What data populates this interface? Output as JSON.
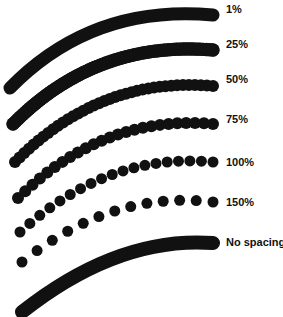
{
  "figure": {
    "background_color": "#ffffff",
    "ink_color": "#111111",
    "width": 283,
    "height": 317
  },
  "labels": [
    {
      "text": "1%",
      "x": 226,
      "y": 3
    },
    {
      "text": "25%",
      "x": 226,
      "y": 38
    },
    {
      "text": "50%",
      "x": 226,
      "y": 73
    },
    {
      "text": "75%",
      "x": 226,
      "y": 113
    },
    {
      "text": "100%",
      "x": 226,
      "y": 156
    },
    {
      "text": "150%",
      "x": 226,
      "y": 196
    },
    {
      "text": "No spacing",
      "x": 226,
      "y": 236
    }
  ],
  "chart_data": {
    "type": "scatter",
    "xlabel": "",
    "ylabel": "",
    "grid": false,
    "legend_position": "right",
    "categories": [
      "1%",
      "25%",
      "50%",
      "75%",
      "100%",
      "150%",
      "No spacing"
    ],
    "series": [
      {
        "name": "1%",
        "spacing_percent": 1,
        "dot_diameter": 13,
        "dot_step": 1.2,
        "appearance": "solid continuous stroke",
        "arc": {
          "start": [
            10,
            88
          ],
          "ctrl": [
            92,
            4
          ],
          "end": [
            213,
            15
          ]
        }
      },
      {
        "name": "25%",
        "spacing_percent": 25,
        "dot_diameter": 13,
        "dot_step": 3.2,
        "appearance": "solid stroke, faint scalloped edge",
        "arc": {
          "start": [
            13,
            124
          ],
          "ctrl": [
            96,
            40
          ],
          "end": [
            213,
            50
          ]
        }
      },
      {
        "name": "50%",
        "spacing_percent": 50,
        "dot_diameter": 12,
        "dot_step": 6.0,
        "appearance": "beaded stroke, dots overlapping heavily",
        "arc": {
          "start": [
            15,
            162
          ],
          "ctrl": [
            100,
            76
          ],
          "end": [
            213,
            86
          ]
        }
      },
      {
        "name": "75%",
        "spacing_percent": 75,
        "dot_diameter": 12,
        "dot_step": 9.0,
        "appearance": "beaded stroke, dots clearly visible",
        "arc": {
          "start": [
            18,
            198
          ],
          "ctrl": [
            104,
            114
          ],
          "end": [
            213,
            124
          ]
        }
      },
      {
        "name": "100%",
        "spacing_percent": 100,
        "dot_diameter": 11,
        "dot_step": 11.5,
        "appearance": "dots just touching",
        "arc": {
          "start": [
            20,
            232
          ],
          "ctrl": [
            108,
            152
          ],
          "end": [
            213,
            162
          ]
        }
      },
      {
        "name": "150%",
        "spacing_percent": 150,
        "dot_diameter": 11,
        "dot_step": 17.0,
        "appearance": "separated round dots",
        "arc": {
          "start": [
            22,
            262
          ],
          "ctrl": [
            112,
            190
          ],
          "end": [
            213,
            202
          ]
        }
      },
      {
        "name": "No spacing",
        "spacing_percent": null,
        "dot_diameter": 14,
        "dot_step": 1.0,
        "appearance": "single continuous irregular stroke, no dot spacing applied",
        "arc": {
          "start": [
            22,
            312
          ],
          "ctrl": [
            118,
            236
          ],
          "end": [
            213,
            243
          ]
        }
      }
    ]
  }
}
